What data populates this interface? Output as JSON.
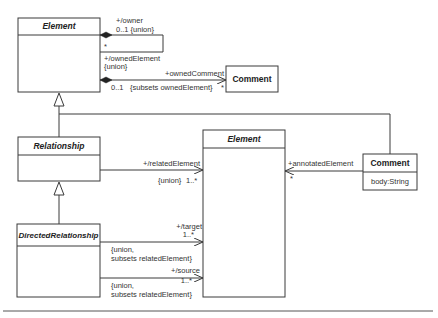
{
  "diagram": {
    "classes": {
      "element_top": {
        "name": "Element",
        "abstract": true
      },
      "comment_top": {
        "name": "Comment",
        "abstract": false
      },
      "relationship": {
        "name": "Relationship",
        "abstract": true
      },
      "directed_relationship": {
        "name": "DirectedRelationship",
        "abstract": true
      },
      "element_mid": {
        "name": "Element",
        "abstract": true
      },
      "comment_right": {
        "name": "Comment",
        "abstract": false,
        "attributes": [
          "body:String"
        ]
      }
    },
    "associations": {
      "owner": {
        "role": "+/owner",
        "multiplicity": "0..1 {union}",
        "other_end_multiplicity": "*",
        "other_role": "+/ownedElement",
        "other_constraint": "{union}"
      },
      "owned_comment": {
        "role": "+ownedComment",
        "source_multiplicity": "0..1",
        "constraint": "{subsets ownedElement}",
        "target_multiplicity": "*"
      },
      "related_element": {
        "role": "+/relatedElement",
        "constraint": "{union}",
        "multiplicity": "1..*"
      },
      "target": {
        "role": "+/target",
        "multiplicity": "1..*",
        "constraint_line1": "{union,",
        "constraint_line2": "subsets relatedElement}"
      },
      "source": {
        "role": "+/source",
        "multiplicity": "1..*",
        "constraint_line1": "{union,",
        "constraint_line2": "subsets relatedElement}"
      },
      "annotated_element": {
        "role": "+annotatedElement",
        "multiplicity": "*"
      }
    }
  }
}
